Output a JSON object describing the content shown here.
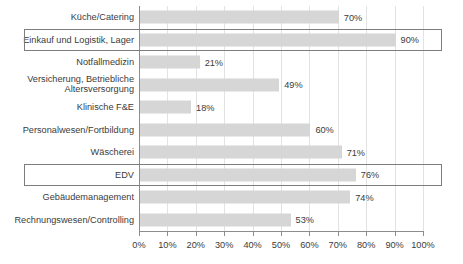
{
  "chart_data": {
    "type": "bar",
    "orientation": "horizontal",
    "title": "",
    "xlabel": "",
    "ylabel": "",
    "xlim": [
      0,
      100
    ],
    "xticks": [
      "0%",
      "10%",
      "20%",
      "30%",
      "40%",
      "50%",
      "60%",
      "70%",
      "80%",
      "90%",
      "100%"
    ],
    "xtick_values": [
      0,
      10,
      20,
      30,
      40,
      50,
      60,
      70,
      80,
      90,
      100
    ],
    "grid": true,
    "grid_axis": "x",
    "legend": "none",
    "bar_color": "#d6d6d6",
    "highlight_border_color": "#7d7d7d",
    "axis_color": "#8d8d8d",
    "categories": [
      "Küche/Catering",
      "Einkauf und Logistik, Lager",
      "Notfallmedizin",
      "Versicherung, Betriebliche\nAltersversorgung",
      "Klinische F&E",
      "Personalwesen/Fortbildung",
      "Wäscherei",
      "EDV",
      "Gebäudemanagement",
      "Rechnungswesen/Controlling"
    ],
    "values": [
      70,
      90,
      21,
      49,
      18,
      60,
      71,
      76,
      74,
      53
    ],
    "value_labels": [
      "70%",
      "90%",
      "21%",
      "49%",
      "18%",
      "60%",
      "71%",
      "76%",
      "74%",
      "53%"
    ],
    "highlighted": [
      false,
      true,
      false,
      false,
      false,
      false,
      false,
      true,
      false,
      false
    ]
  }
}
